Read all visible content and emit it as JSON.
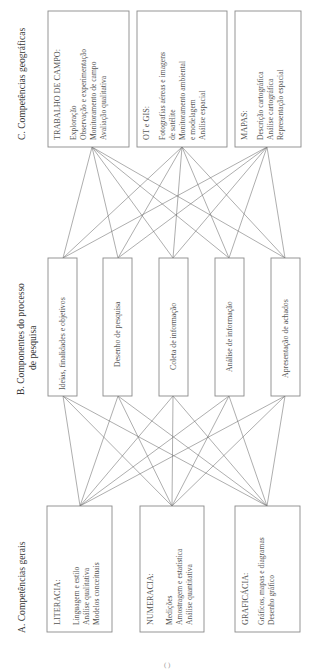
{
  "sections": {
    "A": {
      "label": "A. Competências gerais"
    },
    "B": {
      "label_line1": "B. Componentes do processo",
      "label_line2": "de pesquisa"
    },
    "C": {
      "label": "C. Competências geográficas"
    }
  },
  "general_competences": [
    {
      "title": "LITERACIA:",
      "items": [
        "Linguagem e estilo",
        "Análise qualitativa",
        "Modelos conceituais"
      ]
    },
    {
      "title": "NUMERACIA:",
      "items": [
        "Medições",
        "Amostragem e estatística",
        "Análise quantitativa"
      ]
    },
    {
      "title": "GRAFICÁCIA:",
      "items": [
        "Gráficos, mapas e diagramas",
        "Desenho gráfico"
      ]
    }
  ],
  "research_components": [
    {
      "label": "Ideias, finalidades e objetivos"
    },
    {
      "label": "Desenho de pesquisa"
    },
    {
      "label": "Coleta de informação"
    },
    {
      "label": "Análise de informação"
    },
    {
      "label": "Apresentação de achados"
    }
  ],
  "geographic_competences": [
    {
      "title": "TRABALHO DE CAMPO:",
      "items": [
        "Exploração",
        "Observação e experimentação",
        "Monitoramento de campo",
        "Avaliação qualitativa"
      ]
    },
    {
      "title": "OT e GIS:",
      "items": [
        "Fotografias aéreas e imagens",
        "de satélite",
        "Monitoramento ambiental",
        "e modelagem",
        "Análise espacial"
      ]
    },
    {
      "title": "MAPAS:",
      "items": [
        "Descrição cartográfica",
        "Análise cartográfica",
        "Representação espacial"
      ]
    }
  ],
  "connections": {
    "A_to_B": "every general competence connects to every research component",
    "C_to_B": "every geographic competence connects to every research component"
  },
  "page_marker": "(   )"
}
